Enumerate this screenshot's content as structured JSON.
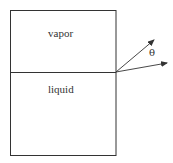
{
  "diagram": {
    "regions": {
      "top_label": "vapor",
      "bottom_label": "liquid"
    },
    "angle_label": "θ",
    "colors": {
      "stroke": "#333333",
      "background": "#ffffff"
    }
  }
}
